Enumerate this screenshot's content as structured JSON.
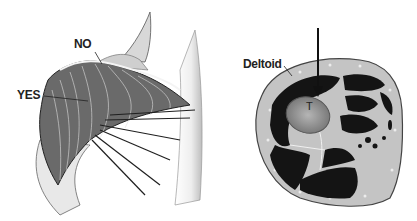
{
  "figure": {
    "left_panel": {
      "description": "Shoulder deltoid muscle illustration with injection site markers",
      "labels": [
        {
          "id": "no",
          "text": "NO"
        },
        {
          "id": "yes",
          "text": "YES"
        }
      ]
    },
    "right_panel": {
      "description": "Cross-section of upper arm showing deltoid and humerus with arrow indicating injection site",
      "labels": [
        {
          "id": "deltoid",
          "text": "Deltoid"
        },
        {
          "id": "t",
          "text": "T"
        }
      ]
    }
  },
  "colors": {
    "background": "#ffffff",
    "muscle_dark": "#1a1a1a",
    "bone": "#8a8a8a",
    "skin_outline": "#555555",
    "fat_layer": "#b8b8b8"
  }
}
